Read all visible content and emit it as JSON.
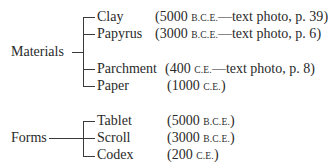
{
  "groups": [
    {
      "label": "Materials",
      "items": [
        {
          "name": "Clay",
          "year": "5000",
          "era": "B.C.E.",
          "note": "—text photo, p. 39"
        },
        {
          "name": "Papyrus",
          "year": "3000",
          "era": "B.C.E.",
          "note": "—text photo, p. 6"
        },
        {
          "name": "Parchment",
          "year": "400",
          "era": "C.E.",
          "note": "—text photo, p. 8"
        },
        {
          "name": "Paper",
          "year": "1000",
          "era": "C.E.",
          "note": ""
        }
      ]
    },
    {
      "label": "Forms",
      "items": [
        {
          "name": "Tablet",
          "year": "5000",
          "era": "B.C.E.",
          "note": ""
        },
        {
          "name": "Scroll",
          "year": "3000",
          "era": "B.C.E.",
          "note": ""
        },
        {
          "name": "Codex",
          "year": "200",
          "era": "C.E.",
          "note": ""
        }
      ]
    }
  ],
  "punct": {
    "open": "(",
    "close": ")",
    "space": " "
  }
}
